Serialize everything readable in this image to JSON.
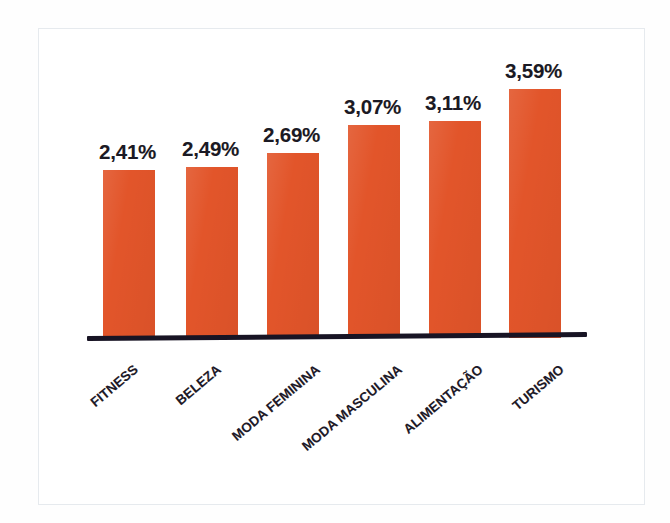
{
  "figure": {
    "background_color": "#ffffff",
    "frame_color": "#e6eaee",
    "bar_color": "#e2552a",
    "label_color": "#1b1a24",
    "axis_color": "#181424"
  },
  "chart_data": {
    "type": "bar",
    "title": "",
    "subtitle": "",
    "xlabel": "",
    "ylabel": "",
    "grid": false,
    "legend": false,
    "legend_position": "none",
    "orientation": "vertical",
    "value_suffix": "%",
    "decimal_separator": ",",
    "ylim": [
      0,
      4.0
    ],
    "categories": [
      "FITNESS",
      "BELEZA",
      "MODA FEMININA",
      "MODA MASCULINA",
      "ALIMENTAÇÃO",
      "TURISMO"
    ],
    "values": [
      2.41,
      2.49,
      2.69,
      3.07,
      3.11,
      3.59
    ],
    "data_labels": [
      "2,41%",
      "2,49%",
      "2,69%",
      "3,07%",
      "3,11%",
      "3,59%"
    ],
    "series": [
      {
        "name": "",
        "color": "#e2552a",
        "values": [
          2.41,
          2.49,
          2.69,
          3.07,
          3.11,
          3.59
        ]
      }
    ]
  },
  "bars": [
    {
      "category": "FITNESS",
      "label": "2,41%",
      "value": 2.41,
      "left": 103,
      "width": 52,
      "top": 170,
      "height": 168,
      "label_left": 99,
      "label_top": 140,
      "cat_anchor_x": 136,
      "cat_anchor_y": 360
    },
    {
      "category": "BELEZA",
      "label": "2,49%",
      "value": 2.49,
      "left": 186,
      "width": 52,
      "top": 167,
      "height": 171,
      "label_left": 182,
      "label_top": 137,
      "cat_anchor_x": 219,
      "cat_anchor_y": 360
    },
    {
      "category": "MODA FEMININA",
      "label": "2,69%",
      "value": 2.69,
      "left": 267,
      "width": 52,
      "top": 153,
      "height": 185,
      "label_left": 263,
      "label_top": 123,
      "cat_anchor_x": 318,
      "cat_anchor_y": 360
    },
    {
      "category": "MODA MASCULINA",
      "label": "3,07%",
      "value": 3.07,
      "left": 348,
      "width": 52,
      "top": 125,
      "height": 213,
      "label_left": 344,
      "label_top": 95,
      "cat_anchor_x": 400,
      "cat_anchor_y": 360
    },
    {
      "category": "ALIMENTAÇÃO",
      "label": "3,11%",
      "value": 3.11,
      "left": 429,
      "width": 52,
      "top": 121,
      "height": 217,
      "label_left": 425,
      "label_top": 91,
      "cat_anchor_x": 481,
      "cat_anchor_y": 360
    },
    {
      "category": "TURISMO",
      "label": "3,59%",
      "value": 3.59,
      "left": 509,
      "width": 52,
      "top": 89,
      "height": 249,
      "label_left": 505,
      "label_top": 59,
      "cat_anchor_x": 562,
      "cat_anchor_y": 360
    }
  ]
}
